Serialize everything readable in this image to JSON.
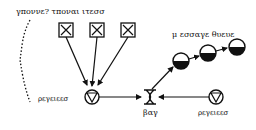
{
  "labels": {
    "top_label": "γποννε? τποναι ιτεσσ",
    "queue_label": "μ εσσαγε θυευε",
    "left_source_label": "ρεγειεεσ",
    "bag_label": "βαγ",
    "right_source_label": "ρεγειεεσ"
  },
  "elements": {
    "boxes": [
      {
        "name": "box-1",
        "icon": "box-x-icon"
      },
      {
        "name": "box-2",
        "icon": "box-x-icon"
      },
      {
        "name": "box-3",
        "icon": "box-x-icon"
      }
    ],
    "queue_nodes": [
      {
        "name": "queue-node-1",
        "icon": "half-filled-circle-icon"
      },
      {
        "name": "queue-node-2",
        "icon": "half-filled-circle-icon"
      },
      {
        "name": "queue-node-3",
        "icon": "half-filled-circle-icon"
      }
    ],
    "valves": [
      {
        "name": "left-valve",
        "icon": "valve-triangle-circle-icon"
      },
      {
        "name": "right-valve",
        "icon": "valve-triangle-circle-icon"
      }
    ],
    "bag": {
      "name": "bag",
      "icon": "hourglass-bag-icon"
    }
  },
  "colors": {
    "stroke": "#111111",
    "background": "#ffffff"
  }
}
